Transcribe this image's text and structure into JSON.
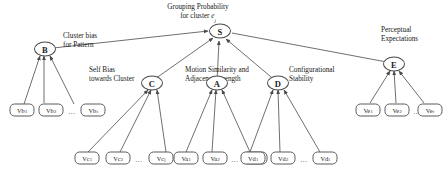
{
  "figure": {
    "type": "hierarchical-graph",
    "background_color": "#ffffff",
    "stroke_color": "#4a4a4a"
  },
  "labels": {
    "root_line1": "Grouping Probability",
    "root_line2_pre": "for cluster ",
    "root_line2_var": "e",
    "root_line2_sub": "j",
    "cluster_bias_line1": "Cluster bias",
    "cluster_bias_line2": "for Pattern",
    "self_bias_line1": "Self Bias",
    "self_bias_line2": "towards Cluster",
    "motion_line1": "Motion Similarity and",
    "motion_line2": "Adjacency strength",
    "config_line1": "Configurational",
    "config_line2": "Stability",
    "perceptual_line1": "Perceptual",
    "perceptual_line2": "Expectations"
  },
  "nodes": {
    "root": {
      "label": "S"
    },
    "major": [
      {
        "id": "B",
        "label": "B"
      },
      {
        "id": "C",
        "label": "C"
      },
      {
        "id": "A",
        "label": "A"
      },
      {
        "id": "D",
        "label": "D"
      },
      {
        "id": "E",
        "label": "E"
      }
    ]
  },
  "leaf_groups": [
    {
      "parent": "B",
      "ellipsis": "...",
      "leaves": [
        {
          "base": "Vb",
          "sub": "1"
        },
        {
          "base": "Vb",
          "sub": "2"
        },
        {
          "base": "Vb",
          "sub": "i"
        }
      ]
    },
    {
      "parent": "C",
      "ellipsis": "...",
      "leaves": [
        {
          "base": "Vc",
          "sub": "1"
        },
        {
          "base": "Vc",
          "sub": "2"
        },
        {
          "base": "Vc",
          "sub": "j"
        }
      ]
    },
    {
      "parent": "A",
      "ellipsis": "...",
      "leaves": [
        {
          "base": "Va",
          "sub": "1"
        },
        {
          "base": "Va",
          "sub": "2"
        },
        {
          "base": "Va",
          "sub": "k"
        }
      ]
    },
    {
      "parent": "D",
      "ellipsis": "...",
      "leaves": [
        {
          "base": "Vd",
          "sub": "1"
        },
        {
          "base": "Vd",
          "sub": "2"
        },
        {
          "base": "Vd",
          "sub": "l"
        }
      ]
    },
    {
      "parent": "E",
      "ellipsis": "...",
      "leaves": [
        {
          "base": "Ve",
          "sub": "1"
        },
        {
          "base": "Ve",
          "sub": "2"
        },
        {
          "base": "Ve",
          "sub": "r"
        }
      ]
    }
  ]
}
